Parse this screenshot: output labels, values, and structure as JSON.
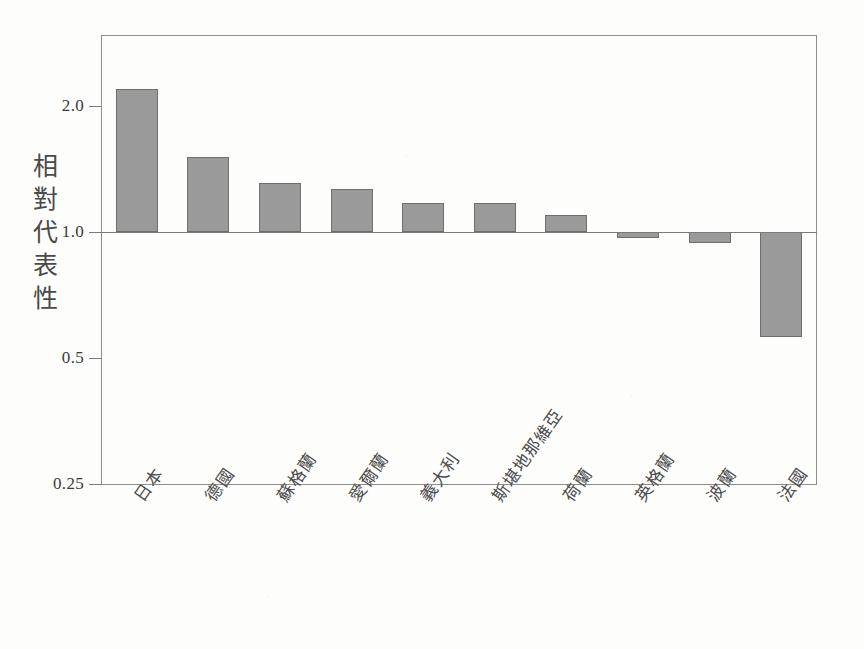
{
  "chart_data": {
    "type": "bar",
    "title": "",
    "subtitle": "",
    "xlabel": "",
    "ylabel": "相對代表性",
    "yscale": "log",
    "ylim": [
      0.25,
      2.6
    ],
    "grid": false,
    "legend": null,
    "baseline": 1.0,
    "ytick_labels": [
      "2.0",
      "1.0",
      "0.5",
      "0.25"
    ],
    "ytick_values": [
      2.0,
      1.0,
      0.5,
      0.25
    ],
    "categories": [
      "日本",
      "德國",
      "蘇格蘭",
      "愛爾蘭",
      "義大利",
      "斯堪地那維亞",
      "荷蘭",
      "英格蘭",
      "波蘭",
      "法國"
    ],
    "values": [
      2.2,
      1.51,
      1.31,
      1.27,
      1.17,
      1.17,
      1.1,
      0.97,
      0.94,
      0.56
    ],
    "bar_color": "#9a9a9a",
    "bar_edge_color": "#6e6e6e",
    "axis_color": "#7a7a7a"
  },
  "axis": {
    "y_title_chars": [
      "相",
      "對",
      "代",
      "表",
      "性"
    ]
  }
}
